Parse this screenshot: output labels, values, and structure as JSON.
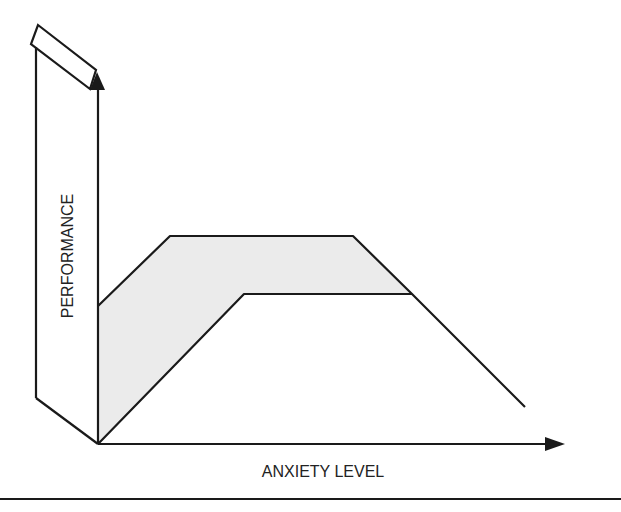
{
  "diagram": {
    "type": "performance-anxiety-curve",
    "x_axis_label": "ANXIETY LEVEL",
    "y_axis_label": "PERFORMANCE",
    "colors": {
      "stroke": "#1a1a1a",
      "band_fill": "#ebebeb",
      "background": "#ffffff"
    },
    "upper_curve": [
      [
        98,
        306
      ],
      [
        170,
        236
      ],
      [
        353,
        236
      ],
      [
        412,
        294
      ]
    ],
    "lower_curve": [
      [
        98,
        444
      ],
      [
        244,
        294
      ],
      [
        412,
        294
      ],
      [
        525,
        407
      ]
    ],
    "origin": [
      98,
      444
    ]
  }
}
